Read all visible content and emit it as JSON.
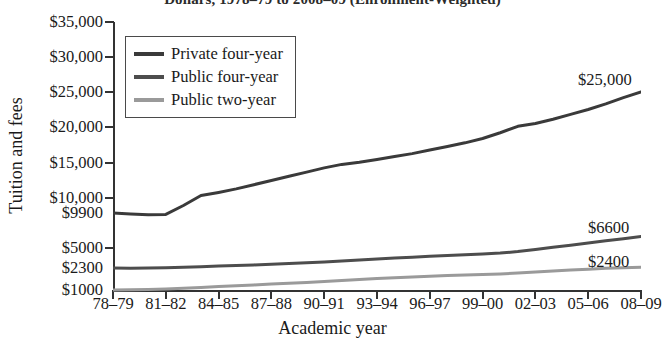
{
  "chart_data": {
    "type": "line",
    "title": "Dollars, 1978–79 to 2008–09 (Enrollment-Weighted)",
    "xlabel": "Academic year",
    "ylabel": "Tuition and fees",
    "grid": false,
    "legend_position": "top-left",
    "x": [
      "78–79",
      "79–80",
      "80–81",
      "81–82",
      "82–83",
      "83–84",
      "84–85",
      "85–86",
      "86–87",
      "87–88",
      "88–89",
      "89–90",
      "90–91",
      "91–92",
      "92–93",
      "93–94",
      "94–95",
      "95–96",
      "96–97",
      "97–98",
      "98–99",
      "99–00",
      "00–01",
      "01–02",
      "02–03",
      "03–04",
      "04–05",
      "05–06",
      "06–07",
      "07–08",
      "08–09"
    ],
    "xtick_labels": [
      "78–79",
      "81–82",
      "84–85",
      "87–88",
      "90–91",
      "93–94",
      "96–97",
      "99–00",
      "02–03",
      "05–06",
      "08–09"
    ],
    "ytick_labels": [
      "$35,000",
      "$30,000",
      "$25,000",
      "$20,000",
      "$15,000",
      "$10,000",
      "$9900",
      "$5000",
      "$2300",
      "$1000"
    ],
    "ytick_values": [
      35000,
      30000,
      25000,
      20000,
      15000,
      10000,
      9900,
      5000,
      2300,
      1000
    ],
    "ylim": [
      1000,
      35000
    ],
    "series": [
      {
        "name": "Private four-year",
        "color": "#3a3a3a",
        "start_value": 9900,
        "end_value": 25000,
        "end_label": "$25,000",
        "values": [
          9900,
          9750,
          9650,
          9700,
          9950,
          10350,
          10800,
          11300,
          11900,
          12500,
          13100,
          13700,
          14300,
          14800,
          15100,
          15500,
          15900,
          16300,
          16800,
          17300,
          17800,
          18400,
          19200,
          20100,
          20500,
          21100,
          21800,
          22500,
          23300,
          24200,
          25000
        ]
      },
      {
        "name": "Public four-year",
        "color": "#4d4d4d",
        "start_value": 2300,
        "end_value": 6600,
        "end_label": "$6600",
        "values": [
          2300,
          2290,
          2300,
          2330,
          2400,
          2480,
          2560,
          2640,
          2720,
          2810,
          2900,
          3000,
          3100,
          3240,
          3380,
          3520,
          3650,
          3760,
          3870,
          3980,
          4080,
          4180,
          4320,
          4520,
          4800,
          5100,
          5400,
          5700,
          6000,
          6300,
          6600
        ]
      },
      {
        "name": "Public two-year",
        "color": "#9a9a9a",
        "start_value": 1000,
        "end_value": 2400,
        "end_label": "$2400",
        "values": [
          1000,
          1010,
          1030,
          1060,
          1100,
          1150,
          1200,
          1250,
          1300,
          1350,
          1400,
          1450,
          1500,
          1560,
          1620,
          1680,
          1730,
          1770,
          1810,
          1850,
          1880,
          1910,
          1950,
          2000,
          2060,
          2120,
          2180,
          2230,
          2280,
          2340,
          2400
        ]
      }
    ]
  },
  "legend": {
    "items": [
      {
        "label": "Private four-year",
        "color": "#3a3a3a"
      },
      {
        "label": "Public four-year",
        "color": "#4d4d4d"
      },
      {
        "label": "Public two-year",
        "color": "#9a9a9a"
      }
    ]
  }
}
